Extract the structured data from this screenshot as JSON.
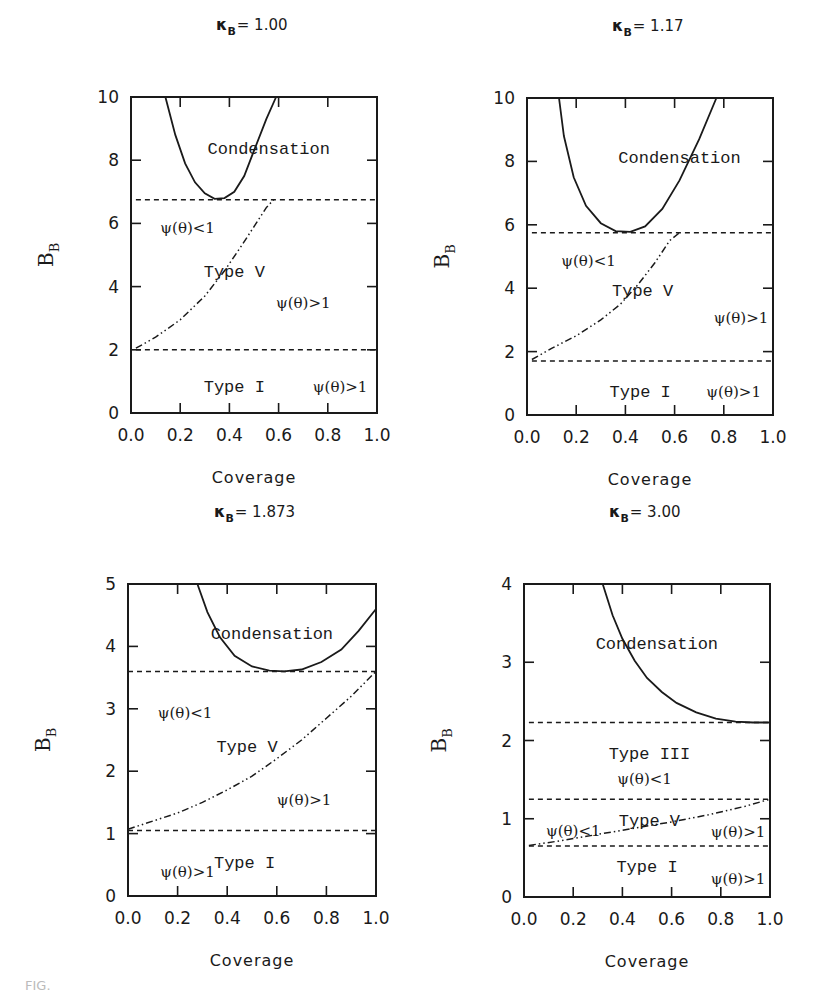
{
  "figure": {
    "caption_fragment": "FIG."
  },
  "chart_data": [
    {
      "type": "line",
      "title": "κB = 1.00",
      "title_symbol": "κ",
      "title_subscript": "B",
      "title_value": "= 1.00",
      "xlabel": "Coverage",
      "ylabel": "B",
      "ylabel_subscript": "B",
      "xlim": [
        0.0,
        1.0
      ],
      "ylim": [
        0,
        10
      ],
      "xticks": [
        "0.0",
        "0.2",
        "0.4",
        "0.6",
        "0.8",
        "1.0"
      ],
      "yticks": [
        "0",
        "2",
        "4",
        "6",
        "8",
        "10"
      ],
      "ytick_values": [
        0,
        2,
        4,
        6,
        8,
        10
      ],
      "grid": false,
      "frame_px": {
        "left": 131,
        "top": 97,
        "right": 377,
        "bottom": 413
      },
      "series": [
        {
          "name": "Condensation boundary",
          "style": "solid",
          "x": [
            0.14,
            0.18,
            0.22,
            0.26,
            0.3,
            0.34,
            0.38,
            0.42,
            0.46,
            0.5,
            0.55,
            0.59
          ],
          "y": [
            10.0,
            8.8,
            7.9,
            7.3,
            6.95,
            6.78,
            6.8,
            7.0,
            7.5,
            8.3,
            9.3,
            10.0
          ]
        },
        {
          "name": "Upper dashed threshold",
          "style": "dashed",
          "x": [
            0.02,
            1.0
          ],
          "y": [
            6.75,
            6.75
          ]
        },
        {
          "name": "Lower dashed threshold",
          "style": "dashed",
          "x": [
            0.02,
            1.0
          ],
          "y": [
            2.0,
            2.0
          ]
        },
        {
          "name": "ψ(θ)=1 boundary",
          "style": "dashdot",
          "x": [
            0.02,
            0.1,
            0.2,
            0.3,
            0.38,
            0.45,
            0.5,
            0.55,
            0.58
          ],
          "y": [
            2.05,
            2.4,
            2.95,
            3.7,
            4.5,
            5.3,
            5.9,
            6.5,
            6.75
          ]
        }
      ],
      "annotations": [
        {
          "text": "Condensation",
          "kind": "region",
          "x": 0.56,
          "y": 8.4
        },
        {
          "text": "ψ(θ)<1",
          "kind": "annot",
          "x": 0.23,
          "y": 5.9
        },
        {
          "text": "Type V",
          "kind": "region",
          "x": 0.42,
          "y": 4.5
        },
        {
          "text": "ψ(θ)>1",
          "kind": "annot",
          "x": 0.7,
          "y": 3.5
        },
        {
          "text": "Type I",
          "kind": "region",
          "x": 0.42,
          "y": 0.85
        },
        {
          "text": "ψ(θ)>1",
          "kind": "annot",
          "x": 0.85,
          "y": 0.85
        }
      ]
    },
    {
      "type": "line",
      "title": "κB = 1.17",
      "title_symbol": "κ",
      "title_subscript": "B",
      "title_value": "= 1.17",
      "xlabel": "Coverage",
      "ylabel": "B",
      "ylabel_subscript": "B",
      "xlim": [
        0.0,
        1.0
      ],
      "ylim": [
        0,
        10
      ],
      "xticks": [
        "0.0",
        "0.2",
        "0.4",
        "0.6",
        "0.8",
        "1.0"
      ],
      "yticks": [
        "0",
        "2",
        "4",
        "6",
        "8",
        "10"
      ],
      "ytick_values": [
        0,
        2,
        4,
        6,
        8,
        10
      ],
      "grid": false,
      "frame_px": {
        "left": 527,
        "top": 98,
        "right": 773,
        "bottom": 415
      },
      "series": [
        {
          "name": "Condensation boundary",
          "style": "solid",
          "x": [
            0.13,
            0.15,
            0.19,
            0.24,
            0.3,
            0.36,
            0.42,
            0.48,
            0.55,
            0.62,
            0.7,
            0.77
          ],
          "y": [
            10.0,
            8.8,
            7.5,
            6.6,
            6.05,
            5.8,
            5.78,
            5.95,
            6.5,
            7.4,
            8.7,
            10.0
          ]
        },
        {
          "name": "Upper dashed threshold",
          "style": "dashed",
          "x": [
            0.02,
            1.0
          ],
          "y": [
            5.75,
            5.75
          ]
        },
        {
          "name": "Lower dashed threshold",
          "style": "dashed",
          "x": [
            0.02,
            1.0
          ],
          "y": [
            1.7,
            1.7
          ]
        },
        {
          "name": "ψ(θ)=1 boundary",
          "style": "dashdot",
          "x": [
            0.02,
            0.1,
            0.2,
            0.3,
            0.38,
            0.45,
            0.52,
            0.58,
            0.62
          ],
          "y": [
            1.75,
            2.1,
            2.5,
            3.0,
            3.5,
            4.1,
            4.8,
            5.5,
            5.75
          ]
        }
      ],
      "annotations": [
        {
          "text": "Condensation",
          "kind": "region",
          "x": 0.62,
          "y": 8.15
        },
        {
          "text": "ψ(θ)<1",
          "kind": "annot",
          "x": 0.25,
          "y": 4.9
        },
        {
          "text": "Type V",
          "kind": "region",
          "x": 0.47,
          "y": 3.95
        },
        {
          "text": "ψ(θ)>1",
          "kind": "annot",
          "x": 0.87,
          "y": 3.1
        },
        {
          "text": "Type I",
          "kind": "region",
          "x": 0.46,
          "y": 0.75
        },
        {
          "text": "ψ(θ)>1",
          "kind": "annot",
          "x": 0.84,
          "y": 0.75
        }
      ]
    },
    {
      "type": "line",
      "title": "κB = 1.873",
      "title_symbol": "κ",
      "title_subscript": "B",
      "title_value": "= 1.873",
      "xlabel": "Coverage",
      "ylabel": "B",
      "ylabel_subscript": "B",
      "xlim": [
        0.0,
        1.0
      ],
      "ylim": [
        0,
        5
      ],
      "xticks": [
        "0.0",
        "0.2",
        "0.4",
        "0.6",
        "0.8",
        "1.0"
      ],
      "yticks": [
        "0",
        "1",
        "2",
        "3",
        "4",
        "5"
      ],
      "ytick_values": [
        0,
        1,
        2,
        3,
        4,
        5
      ],
      "grid": false,
      "frame_px": {
        "left": 128,
        "top": 584,
        "right": 376,
        "bottom": 896
      },
      "series": [
        {
          "name": "Condensation boundary",
          "style": "solid",
          "x": [
            0.28,
            0.32,
            0.37,
            0.43,
            0.5,
            0.57,
            0.63,
            0.7,
            0.78,
            0.86,
            0.93,
            1.0
          ],
          "y": [
            5.0,
            4.55,
            4.15,
            3.85,
            3.68,
            3.61,
            3.6,
            3.63,
            3.75,
            3.95,
            4.25,
            4.6
          ]
        },
        {
          "name": "Upper dashed threshold",
          "style": "dashed",
          "x": [
            0.0,
            1.0
          ],
          "y": [
            3.6,
            3.6
          ]
        },
        {
          "name": "Lower dashed threshold",
          "style": "dashed",
          "x": [
            0.0,
            1.0
          ],
          "y": [
            1.05,
            1.05
          ]
        },
        {
          "name": "ψ(θ)=1 boundary",
          "style": "dashdot",
          "x": [
            0.0,
            0.1,
            0.2,
            0.3,
            0.4,
            0.5,
            0.6,
            0.7,
            0.8,
            0.9,
            1.0
          ],
          "y": [
            1.07,
            1.2,
            1.33,
            1.5,
            1.7,
            1.92,
            2.2,
            2.5,
            2.85,
            3.2,
            3.6
          ]
        }
      ],
      "annotations": [
        {
          "text": "Condensation",
          "kind": "region",
          "x": 0.58,
          "y": 4.22
        },
        {
          "text": "ψ(θ)<1",
          "kind": "annot",
          "x": 0.23,
          "y": 2.95
        },
        {
          "text": "Type V",
          "kind": "region",
          "x": 0.48,
          "y": 2.4
        },
        {
          "text": "ψ(θ)>1",
          "kind": "annot",
          "x": 0.71,
          "y": 1.55
        },
        {
          "text": "Type I",
          "kind": "region",
          "x": 0.47,
          "y": 0.55
        },
        {
          "text": "ψ(θ)>1",
          "kind": "annot",
          "x": 0.24,
          "y": 0.4
        }
      ]
    },
    {
      "type": "line",
      "title": "κB = 3.00",
      "title_symbol": "κ",
      "title_subscript": "B",
      "title_value": "= 3.00",
      "xlabel": "Coverage",
      "ylabel": "B",
      "ylabel_subscript": "B",
      "xlim": [
        0.0,
        1.0
      ],
      "ylim": [
        0,
        4
      ],
      "xticks": [
        "0.0",
        "0.2",
        "0.4",
        "0.6",
        "0.8",
        "1.0"
      ],
      "yticks": [
        "0",
        "1",
        "2",
        "3",
        "4"
      ],
      "ytick_values": [
        0,
        1,
        2,
        3,
        4
      ],
      "grid": false,
      "frame_px": {
        "left": 524,
        "top": 584,
        "right": 770,
        "bottom": 897
      },
      "series": [
        {
          "name": "Condensation boundary",
          "style": "solid",
          "x": [
            0.32,
            0.36,
            0.4,
            0.45,
            0.5,
            0.56,
            0.62,
            0.7,
            0.78,
            0.86,
            0.93,
            1.0
          ],
          "y": [
            4.0,
            3.6,
            3.3,
            3.02,
            2.8,
            2.62,
            2.48,
            2.36,
            2.28,
            2.24,
            2.23,
            2.23
          ]
        },
        {
          "name": "Type III upper dashed threshold",
          "style": "dashed",
          "x": [
            0.02,
            1.0
          ],
          "y": [
            2.23,
            2.23
          ]
        },
        {
          "name": "Middle dashed threshold",
          "style": "dashed",
          "x": [
            0.02,
            1.0
          ],
          "y": [
            1.25,
            1.25
          ]
        },
        {
          "name": "Lower dashed threshold",
          "style": "dashed",
          "x": [
            0.02,
            1.0
          ],
          "y": [
            0.65,
            0.65
          ]
        },
        {
          "name": "ψ(θ)=1 boundary",
          "style": "dashdot",
          "x": [
            0.02,
            0.15,
            0.3,
            0.45,
            0.6,
            0.75,
            0.9,
            1.0
          ],
          "y": [
            0.66,
            0.72,
            0.8,
            0.88,
            0.96,
            1.05,
            1.16,
            1.25
          ]
        }
      ],
      "annotations": [
        {
          "text": "Condensation",
          "kind": "region",
          "x": 0.54,
          "y": 3.24
        },
        {
          "text": "Type III",
          "kind": "region",
          "x": 0.51,
          "y": 1.84
        },
        {
          "text": "ψ(θ)<1",
          "kind": "annot",
          "x": 0.49,
          "y": 1.52
        },
        {
          "text": "ψ(θ)<1",
          "kind": "annot",
          "x": 0.2,
          "y": 0.86
        },
        {
          "text": "Type V",
          "kind": "region",
          "x": 0.51,
          "y": 0.98
        },
        {
          "text": "ψ(θ)>1",
          "kind": "annot",
          "x": 0.87,
          "y": 0.84
        },
        {
          "text": "Type I",
          "kind": "region",
          "x": 0.5,
          "y": 0.4
        },
        {
          "text": "ψ(θ)>1",
          "kind": "annot",
          "x": 0.87,
          "y": 0.24
        }
      ]
    }
  ]
}
